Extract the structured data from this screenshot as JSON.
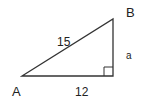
{
  "diagram": {
    "type": "right-triangle",
    "vertices": {
      "A": {
        "label": "A"
      },
      "B": {
        "label": "B"
      },
      "C": {
        "label": ""
      }
    },
    "sides": {
      "hypotenuse": {
        "label": "15",
        "from": "A",
        "to": "B"
      },
      "base": {
        "label": "12",
        "from": "A",
        "to": "C"
      },
      "vertical": {
        "label": "a",
        "from": "C",
        "to": "B"
      }
    },
    "right_angle_at": "C",
    "colors": {
      "stroke": "#333333",
      "text": "#222222",
      "background": "#ffffff"
    }
  }
}
